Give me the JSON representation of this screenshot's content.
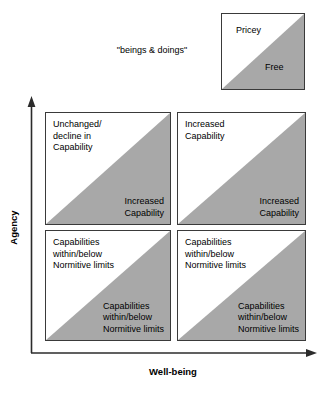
{
  "diagram": {
    "title_caption": "\"beings & doings\"",
    "colors": {
      "shaded": "#a8a8a8",
      "unshaded": "#ffffff",
      "stroke": "#3a3a3a",
      "text": "#000000"
    },
    "axes": {
      "y_label": "Agency",
      "x_label": "Well-being"
    },
    "legend": {
      "upper_label": "Pricey",
      "lower_label": "Free"
    },
    "quadrants": [
      {
        "position": "top-left",
        "upper_text": "Unchanged/\ndecline in\nCapability",
        "lower_text": "Increased\nCapability"
      },
      {
        "position": "top-right",
        "upper_text": "Increased\nCapability",
        "lower_text": "Increased\nCapability"
      },
      {
        "position": "bottom-left",
        "upper_text": "Capabilities\nwithin/below\nNormitive limits",
        "lower_text": "Capabilities\nwithin/below\nNormitive limits"
      },
      {
        "position": "bottom-right",
        "upper_text": "Capabilities\nwithin/below\nNormitive limits",
        "lower_text": "Capabilities\nwithin/below\nNormitive limits"
      }
    ]
  }
}
